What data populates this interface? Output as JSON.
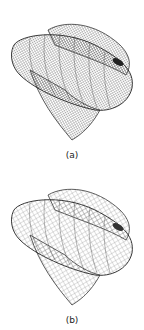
{
  "figure": {
    "panels": [
      {
        "id": "a",
        "caption": "(a)",
        "description": "3D wireframe surface mesh, fine dense grid"
      },
      {
        "id": "b",
        "caption": "(b)",
        "description": "3D wireframe surface mesh, coarser grid"
      }
    ],
    "colors": {
      "mesh": "#333333",
      "background": "#ffffff"
    }
  }
}
